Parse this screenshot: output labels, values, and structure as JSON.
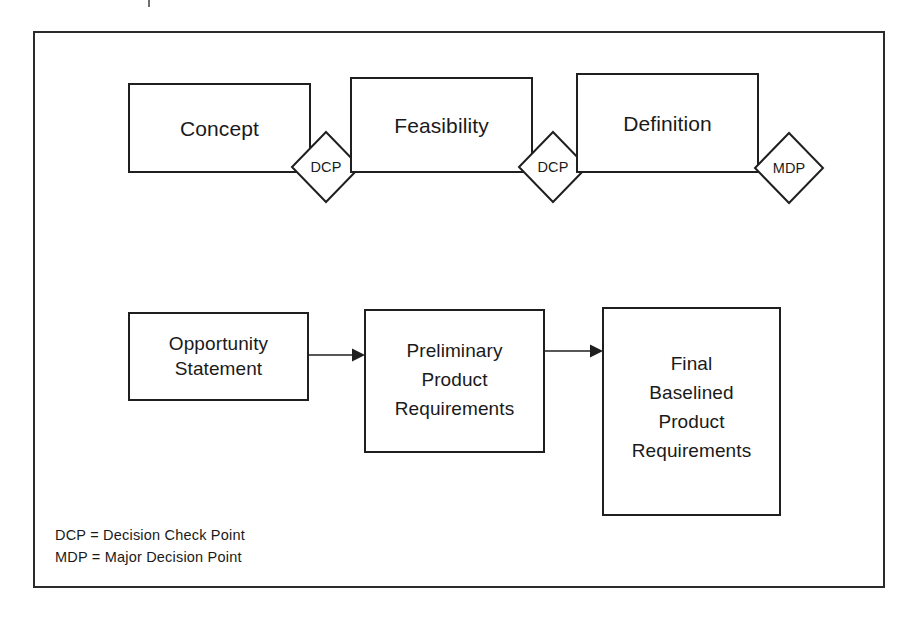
{
  "diagram": {
    "title": "",
    "frame": {
      "stroke": "#2b2b2b"
    },
    "phase_row": {
      "boxes": [
        {
          "id": "concept",
          "label": "Concept"
        },
        {
          "id": "feasibility",
          "label": "Feasibility"
        },
        {
          "id": "definition",
          "label": "Definition"
        }
      ],
      "gates": [
        {
          "id": "gate-1",
          "label": "DCP"
        },
        {
          "id": "gate-2",
          "label": "DCP"
        },
        {
          "id": "gate-3",
          "label": "MDP"
        }
      ]
    },
    "artifact_row": {
      "boxes": [
        {
          "id": "opportunity-statement",
          "lines": [
            "Opportunity",
            "Statement"
          ]
        },
        {
          "id": "preliminary-product-requirements",
          "lines": [
            "Preliminary",
            "Product",
            "Requirements"
          ]
        },
        {
          "id": "final-baselined-product-requirements",
          "lines": [
            "Final",
            "Baselined",
            "Product",
            "Requirements"
          ]
        }
      ],
      "connectors": [
        {
          "id": "arrow-1",
          "from": "opportunity-statement",
          "to": "preliminary-product-requirements"
        },
        {
          "id": "arrow-2",
          "from": "preliminary-product-requirements",
          "to": "final-baselined-product-requirements"
        }
      ]
    },
    "legend": {
      "lines": [
        "DCP = Decision Check Point",
        "MDP = Major Decision Point"
      ]
    },
    "colors": {
      "line": "#1f1f1f",
      "frame": "#2b2b2b",
      "text": "#1a1a1a",
      "background": "#ffffff"
    }
  }
}
